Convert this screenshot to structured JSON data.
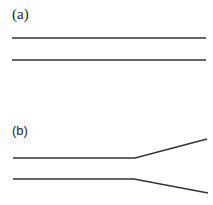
{
  "panels": [
    {
      "label": "(a)",
      "description": "Two parallel horizontal lines (straight channel)",
      "lines": [
        {
          "points": [
            [
              12,
              38
            ],
            [
              206,
              38
            ]
          ]
        },
        {
          "points": [
            [
              12,
              60
            ],
            [
              206,
              60
            ]
          ]
        }
      ]
    },
    {
      "label": "(b)",
      "description": "Two parallel horizontal lines that diverge after a bend (expanding channel)",
      "lines": [
        {
          "points": [
            [
              13,
              158
            ],
            [
              135,
              158
            ],
            [
              207,
              139
            ]
          ]
        },
        {
          "points": [
            [
              13,
              179
            ],
            [
              134,
              179
            ],
            [
              208,
              193
            ]
          ]
        }
      ]
    }
  ],
  "colors": {
    "stroke": "#333333",
    "background": "#ffffff"
  }
}
